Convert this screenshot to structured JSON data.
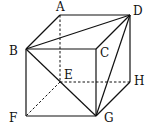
{
  "diagram": {
    "type": "cube",
    "labels": {
      "A": "A",
      "B": "B",
      "C": "C",
      "D": "D",
      "E": "E",
      "F": "F",
      "G": "G",
      "H": "H"
    },
    "vertices": {
      "A": [
        60,
        15
      ],
      "D": [
        130,
        15
      ],
      "B": [
        26,
        49
      ],
      "C": [
        96,
        49
      ],
      "E": [
        60,
        82
      ],
      "H": [
        130,
        82
      ],
      "F": [
        26,
        116
      ],
      "G": [
        96,
        116
      ]
    },
    "solid_edges": [
      "AD",
      "AB",
      "BC",
      "CD",
      "BF",
      "FG",
      "CG",
      "DH",
      "HG",
      "BD",
      "BG",
      "DG"
    ],
    "dashed_edges": [
      "AE",
      "EH",
      "EF"
    ],
    "colors": {
      "line": "#111111",
      "background": "#ffffff"
    }
  }
}
